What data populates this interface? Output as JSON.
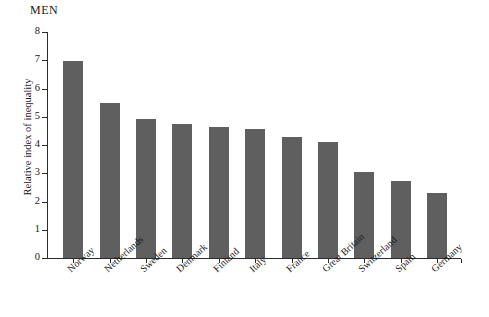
{
  "chart_data": {
    "type": "bar",
    "title": "MEN",
    "xlabel": "",
    "ylabel": "Relative index of inequality",
    "ylim": [
      0,
      8
    ],
    "ytick_labels": [
      "8",
      "7",
      "6",
      "5",
      "4",
      "3",
      "2",
      "1",
      "0"
    ],
    "yticks": [
      8,
      7,
      6,
      5,
      4,
      3,
      2,
      1,
      0
    ],
    "grid": false,
    "legend": null,
    "bar_color": "#5f5f5f",
    "axis_color": "#2b2b2b",
    "categories": [
      "Norway",
      "Netherlands",
      "Sweden",
      "Denmark",
      "Finland",
      "Italy",
      "France",
      "Great Britain",
      "Switzerland",
      "Spain",
      "Germany"
    ],
    "values": [
      6.98,
      5.48,
      4.93,
      4.75,
      4.65,
      4.55,
      4.3,
      4.1,
      3.05,
      2.72,
      2.3
    ]
  }
}
